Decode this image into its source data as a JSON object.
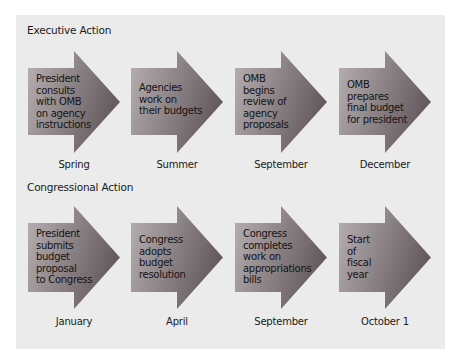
{
  "colors": {
    "panel_bg": "#ebebeb",
    "arrow_light": "#b8b0b2",
    "arrow_dark": "#665c60",
    "text": "#141414"
  },
  "rows": [
    {
      "title": "Executive Action",
      "steps": [
        {
          "text": "President\nconsults\nwith OMB\non agency\ninstructions",
          "label": "Spring"
        },
        {
          "text": "Agencies\nwork on\ntheir budgets",
          "label": "Summer"
        },
        {
          "text": "OMB\nbegins\nreview of\nagency\nproposals",
          "label": "September"
        },
        {
          "text": "OMB\nprepares\nfinal budget\nfor president",
          "label": "December"
        }
      ]
    },
    {
      "title": "Congressional Action",
      "steps": [
        {
          "text": "President\nsubmits\nbudget\nproposal\nto Congress",
          "label": "January"
        },
        {
          "text": "Congress\nadopts\nbudget\nresolution",
          "label": "April"
        },
        {
          "text": "Congress\ncompletes\nwork on\nappropriations\nbills",
          "label": "September"
        },
        {
          "text": "Start\nof\nfiscal\nyear",
          "label": "October 1"
        }
      ]
    }
  ]
}
